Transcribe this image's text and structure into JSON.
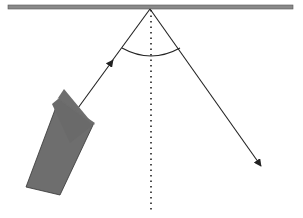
{
  "diagram": {
    "labels": {
      "incoming": "incoming beam",
      "reflected": "reflected beam",
      "normal": "normal",
      "angle_incidence": "i",
      "angle_reflection": "r"
    },
    "colors": {
      "mirror": "#7a7a7a",
      "line": "#222222",
      "flashlight": "#6e6e6e"
    }
  }
}
